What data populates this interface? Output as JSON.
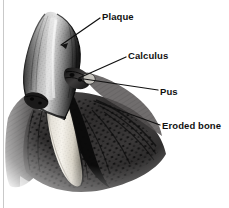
{
  "figure": {
    "width": 229,
    "height": 208,
    "background_color": "#ffffff",
    "rendering": "grayscale pen-and-ink stipple illustration"
  },
  "labels": [
    {
      "id": "plaque",
      "text": "Plaque",
      "text_x": 102,
      "text_y": 12,
      "leader": {
        "x1": 100,
        "y1": 18,
        "x2": 61,
        "y2": 45
      },
      "arrow": true
    },
    {
      "id": "calculus",
      "text": "Calculus",
      "text_x": 128,
      "text_y": 51,
      "leader": {
        "x1": 126,
        "y1": 57,
        "x2": 79,
        "y2": 78
      },
      "arrow": false
    },
    {
      "id": "pus",
      "text": "Pus",
      "text_x": 160,
      "text_y": 87,
      "leader": {
        "x1": 158,
        "y1": 90,
        "x2": 84,
        "y2": 79
      },
      "arrow": false
    },
    {
      "id": "eroded-bone",
      "text": "Eroded bone",
      "text_x": 162,
      "text_y": 121,
      "leader": {
        "x1": 160,
        "y1": 125,
        "x2": 94,
        "y2": 101
      },
      "arrow": false
    }
  ],
  "anatomy": {
    "tooth_crown": "dark stippled enamel crown, apex near (45,14)",
    "tooth_root": "light cream/white root descending to apex near (78,185)",
    "calculus_deposit": "dark textured mass at gum line near (80,78)",
    "gum_tissue": "dark stippled gingiva spanning lower-left to lower-right",
    "bone": "eroded alveolar bone with stipple pattern below gum line"
  },
  "colors": {
    "ink": "#111111",
    "paper": "#ffffff",
    "enamel_dark": "#2a2a2a",
    "enamel_light": "#d8d8d8",
    "root_light": "#f2efe8",
    "tissue_dark": "#1c1c1c",
    "tissue_mid": "#6b6b6b",
    "edge_rule": "#c9c9c9"
  }
}
